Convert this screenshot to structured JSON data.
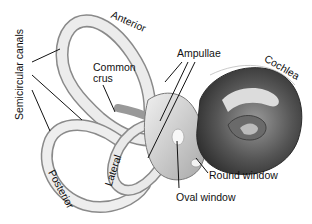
{
  "diagram": {
    "labels": {
      "semicircular_canals": "Semicircular canals",
      "anterior": "Anterior",
      "common_crus": "Common\ncrus",
      "common_crus_line1": "Common",
      "common_crus_line2": "crus",
      "ampullae": "Ampullae",
      "cochlea": "Cochlea",
      "lateral": "Lateral",
      "posterior": "Posterior",
      "round_window": "Round window",
      "oval_window": "Oval window"
    },
    "colors": {
      "background": "#ffffff",
      "line": "#111111",
      "canal_fill": "#e6e6e6",
      "canal_edge": "#8a8a8a",
      "cochlea_dark": "#3a3a3a",
      "cochlea_mid": "#7a7a7a",
      "cochlea_light": "#d8d8d8"
    }
  }
}
